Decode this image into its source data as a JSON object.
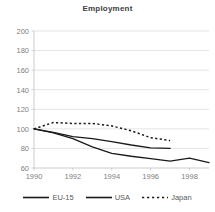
{
  "chart_data": {
    "type": "line",
    "title": "Employment",
    "xlabel": "",
    "ylabel": "",
    "xlim": [
      1990,
      1999
    ],
    "ylim": [
      60,
      200
    ],
    "ytick_step": 20,
    "yticks": [
      60,
      80,
      100,
      120,
      140,
      160,
      180,
      200
    ],
    "xticks": [
      1990,
      1992,
      1994,
      1996,
      1998
    ],
    "grid": true,
    "legend_position": "bottom",
    "x": [
      1990,
      1991,
      1992,
      1993,
      1994,
      1995,
      1996,
      1997,
      1998,
      1999
    ],
    "series": [
      {
        "name": "EU-15",
        "style": "solid",
        "color": "#1a1a1a",
        "x": [
          1990,
          1991,
          1992,
          1993,
          1994,
          1995,
          1996,
          1997,
          1998,
          1999
        ],
        "values": [
          100,
          96,
          90,
          81.5,
          75,
          72,
          69.5,
          67,
          70,
          65.5
        ]
      },
      {
        "name": "USA",
        "style": "solid",
        "color": "#1a1a1a",
        "x": [
          1990,
          1991,
          1992,
          1993,
          1994,
          1995,
          1996,
          1997
        ],
        "values": [
          100,
          96.5,
          92,
          90,
          87,
          83.5,
          80.5,
          80
        ]
      },
      {
        "name": "Japan",
        "style": "dotted",
        "color": "#1a1a1a",
        "x": [
          1990,
          1991,
          1992,
          1993,
          1994,
          1995,
          1996,
          1997
        ],
        "values": [
          100,
          106.5,
          105.5,
          105.5,
          103,
          98,
          91,
          88
        ]
      }
    ]
  },
  "legend": {
    "items": [
      {
        "label": "EU-15",
        "style": "solid"
      },
      {
        "label": "USA",
        "style": "solid"
      },
      {
        "label": "Japan",
        "style": "dotted"
      }
    ]
  },
  "colors": {
    "line": "#1a1a1a",
    "grid": "#d9d9d9",
    "axis": "#bfbfbf",
    "tick_text": "#808080",
    "title_text": "#404040"
  }
}
